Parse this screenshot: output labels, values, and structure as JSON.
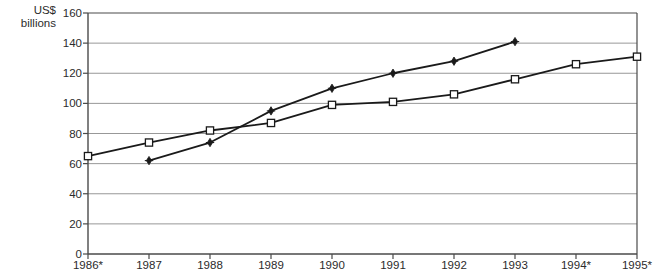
{
  "chart_data": {
    "type": "line",
    "title": "",
    "ylabel": "US$\nbillions",
    "xlabel": "",
    "ylim": [
      0,
      160
    ],
    "yticks": [
      0,
      20,
      40,
      60,
      80,
      100,
      120,
      140,
      160
    ],
    "categories": [
      "1986*",
      "1987",
      "1988",
      "1989",
      "1990",
      "1991",
      "1992",
      "1993",
      "1994*",
      "1995*"
    ],
    "grid": true,
    "legend": "none",
    "series": [
      {
        "name": "series-open-square",
        "marker": "open-square",
        "values": [
          65,
          74,
          82,
          87,
          99,
          101,
          106,
          116,
          126,
          131
        ]
      },
      {
        "name": "series-filled-diamond",
        "marker": "filled-diamond",
        "values": [
          null,
          62,
          74,
          95,
          110,
          120,
          128,
          141,
          null,
          null
        ]
      }
    ]
  },
  "colors": {
    "line": "#1a1a1a",
    "grid": "#8c8c8c",
    "axis": "#4a4a4a",
    "text": "#2b2b2b",
    "marker_fill": "#ffffff"
  },
  "yaxis": {
    "labels": [
      "160",
      "140",
      "120",
      "100",
      "80",
      "60",
      "40",
      "20",
      "0"
    ]
  },
  "xaxis": {
    "labels": [
      "1986*",
      "1987",
      "1988",
      "1989",
      "1990",
      "1991",
      "1992",
      "1993",
      "1994*",
      "1995*"
    ]
  }
}
